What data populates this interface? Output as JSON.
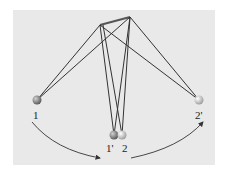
{
  "diagram": {
    "type": "coupled-pendulum-diagram",
    "background_color": "#e9e9e9",
    "line_color": "#333333",
    "pivots": [
      {
        "id": "pivot-left",
        "x": 100,
        "y": 25
      },
      {
        "id": "pivot-right",
        "x": 130,
        "y": 17
      }
    ],
    "bobs": [
      {
        "id": "1",
        "label": "1",
        "x": 37,
        "y": 100,
        "color": "#8a8a8a"
      },
      {
        "id": "1p",
        "label": "1'",
        "x": 114,
        "y": 135,
        "color": "#8a8a8a"
      },
      {
        "id": "2",
        "label": "2",
        "x": 122,
        "y": 135,
        "color": "#c9c9c9"
      },
      {
        "id": "2p",
        "label": "2'",
        "x": 199,
        "y": 100,
        "color": "#c9c9c9"
      }
    ],
    "labels": {
      "bob_1": "1",
      "bob_1_prime": "1'",
      "bob_2": "2",
      "bob_2_prime": "2'"
    },
    "arrows": [
      {
        "id": "arrow-left",
        "from": "1",
        "to": "1'"
      },
      {
        "id": "arrow-right",
        "from": "2",
        "to": "2'"
      }
    ]
  }
}
